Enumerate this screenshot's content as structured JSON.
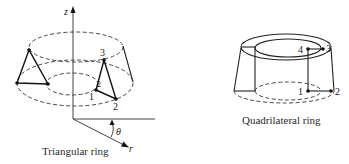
{
  "figure": {
    "background": "#ffffff",
    "line_color": "#222222",
    "triangular_ring": {
      "caption": "Triangular ring",
      "axes": {
        "z_label": "z",
        "r_label": "r",
        "theta_label": "θ"
      },
      "node_labels": [
        "1",
        "2",
        "3"
      ],
      "extra_mark": "2"
    },
    "quadrilateral_ring": {
      "caption": "Quadrilateral ring",
      "node_labels": [
        "1",
        "2",
        "3",
        "4"
      ]
    }
  }
}
